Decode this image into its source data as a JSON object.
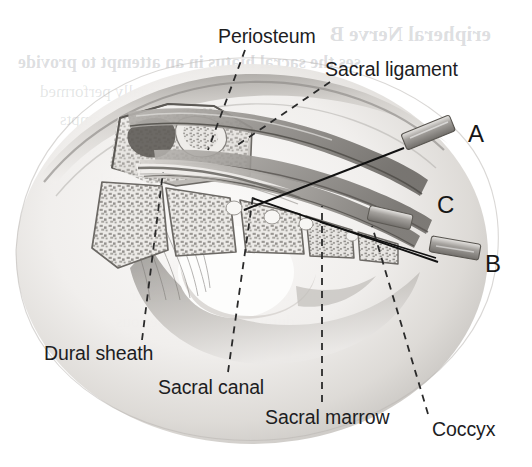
{
  "figure": {
    "kind": "medical-illustration",
    "width": 532,
    "height": 467,
    "background_color": "#ffffff"
  },
  "annotations": [
    {
      "id": "periosteum",
      "label": "Periosteum",
      "x": 218,
      "y": 27,
      "anchor_x": 245,
      "anchor_y": 50,
      "tip_x": 208,
      "tip_y": 150,
      "leader": "dashed"
    },
    {
      "id": "sacral-ligament",
      "label": "Sacral ligament",
      "x": 325,
      "y": 60,
      "anchor_x": 330,
      "anchor_y": 82,
      "tip_x": 236,
      "tip_y": 146,
      "leader": "dashed"
    },
    {
      "id": "dural-sheath",
      "label": "Dural sheath",
      "x": 44,
      "y": 344,
      "anchor_x": 142,
      "anchor_y": 340,
      "tip_x": 163,
      "tip_y": 172,
      "leader": "dashed"
    },
    {
      "id": "sacral-canal",
      "label": "Sacral canal",
      "x": 158,
      "y": 378,
      "anchor_x": 228,
      "anchor_y": 372,
      "tip_x": 253,
      "tip_y": 196,
      "leader": "dashed"
    },
    {
      "id": "sacral-marrow",
      "label": "Sacral marrow",
      "x": 265,
      "y": 408,
      "anchor_x": 322,
      "anchor_y": 402,
      "tip_x": 322,
      "tip_y": 206,
      "leader": "dashed"
    },
    {
      "id": "coccyx",
      "label": "Coccyx",
      "x": 432,
      "y": 420,
      "anchor_x": 428,
      "anchor_y": 414,
      "tip_x": 372,
      "tip_y": 226,
      "leader": "dashed"
    }
  ],
  "markers": [
    {
      "id": "marker-a",
      "label": "A",
      "x": 468,
      "y": 122,
      "needle_angle_deg": 23,
      "description": "Needle A — initial steep insertion angle through the sacral ligament"
    },
    {
      "id": "marker-c",
      "label": "C",
      "x": 437,
      "y": 193,
      "needle_angle_deg": 29,
      "description": "Needle C — solid line marking the final advanced needle track"
    },
    {
      "id": "marker-b",
      "label": "B",
      "x": 485,
      "y": 252,
      "needle_angle_deg": 12,
      "description": "Needle B — flattened angle after entering the sacral canal"
    }
  ],
  "needles": [
    {
      "id": "needle-a",
      "hub_x1": 404,
      "hub_y1": 146,
      "hub_x2": 452,
      "hub_y2": 126,
      "tip_x": 250,
      "tip_y": 206
    },
    {
      "id": "needle-b",
      "hub_x1": 432,
      "hub_y1": 258,
      "hub_x2": 482,
      "hub_y2": 246,
      "tip_x": 262,
      "tip_y": 188
    },
    {
      "id": "needle-c",
      "hub_x1": 370,
      "hub_y1": 214,
      "hub_x2": 430,
      "hub_y2": 228,
      "tip_x": 254,
      "tip_y": 200
    }
  ],
  "bleed_through_text": [
    {
      "text": "eripheral Nerve B",
      "x": 330,
      "y": 22,
      "size": 21,
      "bold": true
    },
    {
      "text": "ses the sacral hiatus in an attempt to provide",
      "x": 18,
      "y": 52,
      "size": 18,
      "bold": true
    },
    {
      "text": "these blocks are usually performed",
      "x": 40,
      "y": 82,
      "size": 17,
      "bold": false
    },
    {
      "text": "may require multiple attempts",
      "x": 60,
      "y": 110,
      "size": 17,
      "bold": false
    },
    {
      "text": "as a single-shot",
      "x": 70,
      "y": 140,
      "size": 17,
      "bold": false
    },
    {
      "text": "considerable",
      "x": 92,
      "y": 170,
      "size": 17,
      "bold": false
    },
    {
      "text": "of cortical bone",
      "x": 118,
      "y": 200,
      "size": 17,
      "bold": false
    },
    {
      "text": "needle is advanced",
      "x": 132,
      "y": 230,
      "size": 17,
      "bold": false
    },
    {
      "text": "during the procedure",
      "x": 150,
      "y": 258,
      "size": 17,
      "bold": false
    },
    {
      "text": "and the risk of intravascular",
      "x": 130,
      "y": 286,
      "size": 17,
      "bold": false
    },
    {
      "text": "dural puncture is a serious",
      "x": 116,
      "y": 312,
      "size": 17,
      "bold": false
    }
  ],
  "palette": {
    "ink": "#1d1d1f",
    "leader_line": "#2a2a2a",
    "needle_line": "#111111",
    "bone_light": "#f2f0ee",
    "bone_mid": "#c9c6c2",
    "bone_dark": "#8d8a86",
    "tissue_light": "#efedeb",
    "tissue_mid": "#d3d0cc",
    "tissue_dark": "#8a8783",
    "canal_dark": "#6f6c68",
    "outline": "#5f5c58"
  }
}
